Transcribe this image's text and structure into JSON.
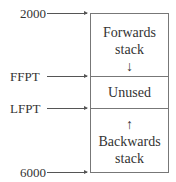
{
  "pointers": [
    {
      "label": "2000",
      "y": 13
    },
    {
      "label": "FFPT",
      "y": 76
    },
    {
      "label": "LFPT",
      "y": 108
    },
    {
      "label": "6000",
      "y": 172
    }
  ],
  "regions": [
    {
      "name": "Forwards stack",
      "line1": "Forwards",
      "line2": "stack",
      "arrow": "↓"
    },
    {
      "name": "Unused",
      "line1": "Unused"
    },
    {
      "name": "Backwards stack",
      "line1": "Backwards",
      "line2": "stack",
      "arrow": "↑"
    }
  ]
}
